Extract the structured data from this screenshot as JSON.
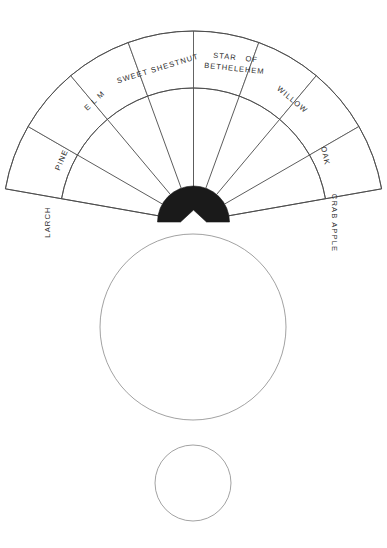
{
  "figure": {
    "title_visible": false,
    "background_color": "#ffffff",
    "line_color": "#4a4a4a",
    "hub_color": "#1a1a1a",
    "circle_color": "#8a8a8a"
  },
  "fan": {
    "center": {
      "x": 193.5,
      "y": 222
    },
    "outer_radius": 191,
    "inner_radius": 134,
    "hub_radius": 36,
    "start_angle_deg": 190,
    "end_angle_deg": 350,
    "segment_count": 8,
    "segments": [
      {
        "index": 0,
        "name": "larch",
        "label": "LARCH",
        "lines": [
          "LARCH"
        ],
        "text_rotation_deg": -90,
        "label_x": 48,
        "label_y": 222
      },
      {
        "index": 1,
        "name": "pine",
        "label": "PINE",
        "lines": [
          "PINE"
        ],
        "text_rotation_deg": -67,
        "label_x": 62,
        "label_y": 160
      },
      {
        "index": 2,
        "name": "elm",
        "label": "ELM",
        "lines": [
          "E L M"
        ],
        "text_rotation_deg": -43,
        "label_x": 95,
        "label_y": 101
      },
      {
        "index": 3,
        "name": "sweet-shestnut",
        "label": "SWEET SHESTNUT",
        "lines": [
          "SWEET SHESTNUT"
        ],
        "text_rotation_deg": -17,
        "label_x": 158,
        "label_y": 69
      },
      {
        "index": 4,
        "name": "star-of-bethelehem",
        "label": "STAR OF BETHELEHEM",
        "lines": [
          "STAR   OF",
          "BETHELEHEM"
        ],
        "text_rotation_deg": 6,
        "label_x": 235,
        "label_y": 63
      },
      {
        "index": 5,
        "name": "willow",
        "label": "WILLOW",
        "lines": [
          "WILLOW"
        ],
        "text_rotation_deg": 40,
        "label_x": 292,
        "label_y": 100
      },
      {
        "index": 6,
        "name": "oak",
        "label": "OAK",
        "lines": [
          "OAK"
        ],
        "text_rotation_deg": 78,
        "label_x": 325,
        "label_y": 156
      },
      {
        "index": 7,
        "name": "crab-apple",
        "label": "CRAB APPLE",
        "lines": [
          "CRAB APPLE"
        ],
        "text_rotation_deg": 90,
        "label_x": 334,
        "label_y": 223
      }
    ]
  },
  "circles": [
    {
      "name": "large-circle",
      "center_x": 193,
      "center_y": 327,
      "radius": 93
    },
    {
      "name": "small-circle",
      "center_x": 193,
      "center_y": 483,
      "radius": 38
    }
  ]
}
